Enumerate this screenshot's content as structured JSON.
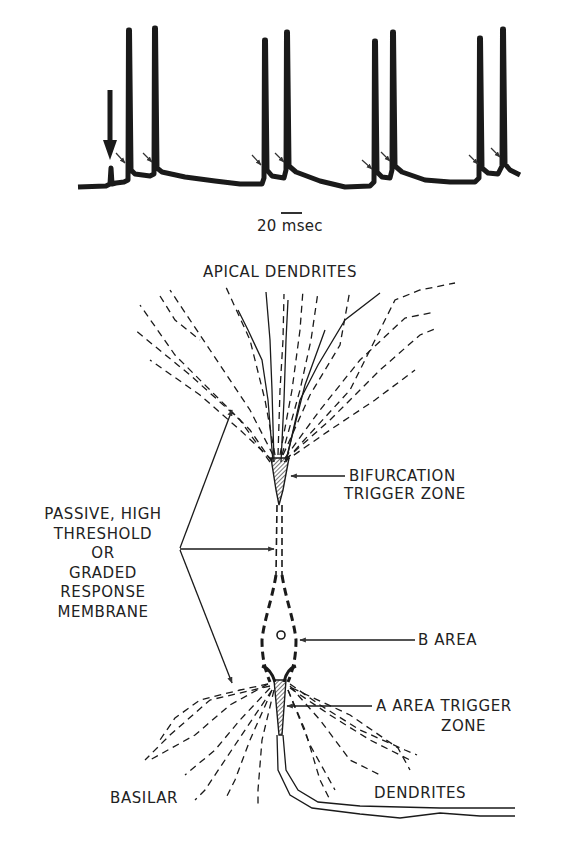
{
  "figure": {
    "trace": {
      "description": "intracellular voltage recording with burst spikes",
      "stimulus_marker": "bold-down-arrow",
      "spike_count": 8,
      "small_arrow_count": 8,
      "scale_bar_label": "20 msec"
    },
    "diagram": {
      "title": "APICAL DENDRITES",
      "labels": {
        "bifurcation_line1": "BIFURCATION",
        "bifurcation_line2": "TRIGGER ZONE",
        "passive_line1": "PASSIVE, HIGH",
        "passive_line2": "THRESHOLD",
        "passive_line3": "OR",
        "passive_line4": "GRADED",
        "passive_line5": "RESPONSE",
        "passive_line6": "MEMBRANE",
        "b_area": "B AREA",
        "a_area_line1": "A AREA TRIGGER",
        "a_area_line2": "ZONE",
        "basilar": "BASILAR",
        "dendrites": "DENDRITES"
      }
    },
    "colors": {
      "ink": "#1a1a1a",
      "background": "#ffffff"
    }
  }
}
